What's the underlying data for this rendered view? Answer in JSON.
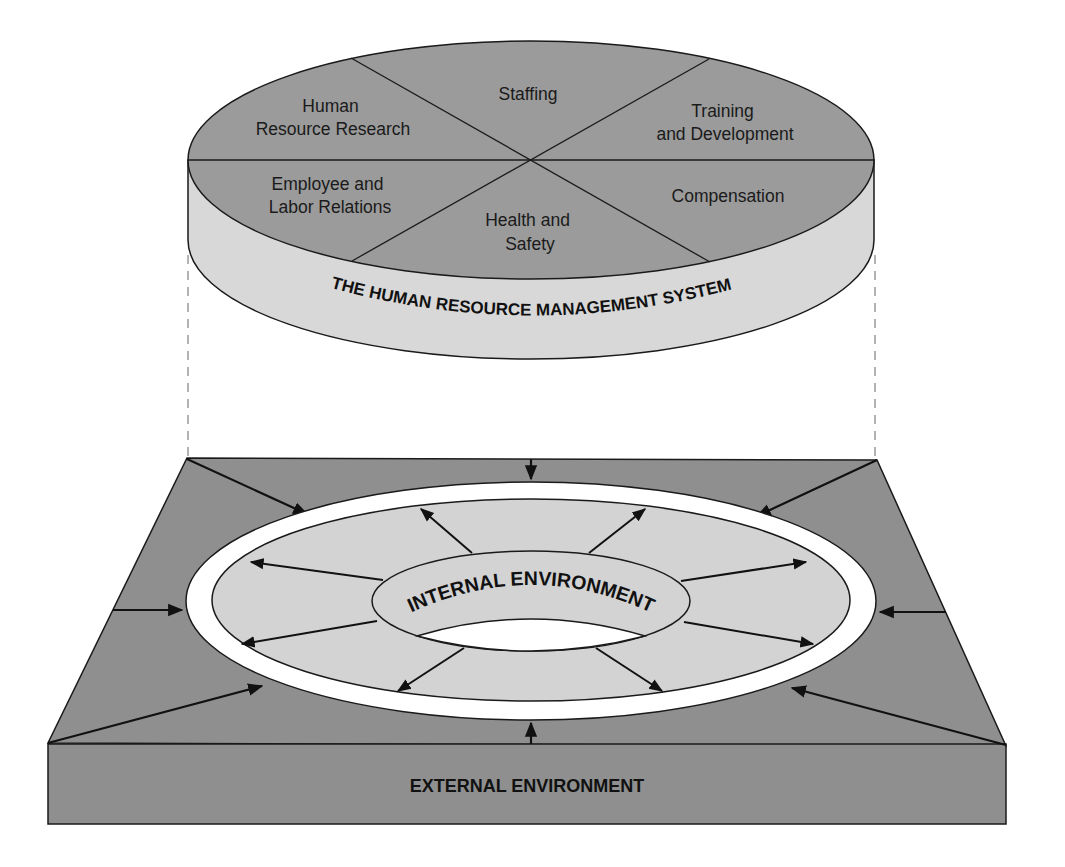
{
  "diagram": {
    "hrm_system": {
      "label": "THE HUMAN RESOURCE MANAGEMENT SYSTEM",
      "segments": [
        {
          "id": "staffing",
          "lines": [
            "Staffing"
          ]
        },
        {
          "id": "training",
          "lines": [
            "Training",
            "and Development"
          ]
        },
        {
          "id": "compensation",
          "lines": [
            "Compensation"
          ]
        },
        {
          "id": "health",
          "lines": [
            "Health and",
            "Safety"
          ]
        },
        {
          "id": "employee",
          "lines": [
            "Employee and",
            "Labor Relations"
          ]
        },
        {
          "id": "research",
          "lines": [
            "Human",
            "Resource Research"
          ]
        }
      ]
    },
    "internal_environment": {
      "label": "INTERNAL ENVIRONMENT"
    },
    "external_environment": {
      "label": "EXTERNAL ENVIRONMENT"
    },
    "colors": {
      "disc_top": "#9b9b9b",
      "disc_side": "#d8d8d8",
      "base": "#8f8f8f",
      "ring_interior": "#d3d3d3",
      "ring": "#ffffff",
      "stroke": "#1a1a1a",
      "dashed": "#9a9a9a"
    }
  }
}
